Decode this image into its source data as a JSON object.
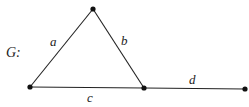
{
  "graph": {
    "name": "G",
    "name_suffix": ":",
    "vertices": [
      {
        "id": "v1",
        "x": 93,
        "y": 9
      },
      {
        "id": "v2",
        "x": 30,
        "y": 87
      },
      {
        "id": "v3",
        "x": 144,
        "y": 88
      },
      {
        "id": "v4",
        "x": 245,
        "y": 89
      }
    ],
    "edges": [
      {
        "label": "a",
        "from": "v2",
        "to": "v1",
        "label_x": 50,
        "label_y": 36
      },
      {
        "label": "b",
        "from": "v1",
        "to": "v3",
        "label_x": 121,
        "label_y": 36
      },
      {
        "label": "c",
        "from": "v2",
        "to": "v3",
        "label_x": 87,
        "label_y": 92
      },
      {
        "label": "d",
        "from": "v3",
        "to": "v4",
        "label_x": 189,
        "label_y": 74
      }
    ]
  },
  "labels": {
    "graph_title": "G:",
    "edge_a": "a",
    "edge_b": "b",
    "edge_c": "c",
    "edge_d": "d"
  }
}
